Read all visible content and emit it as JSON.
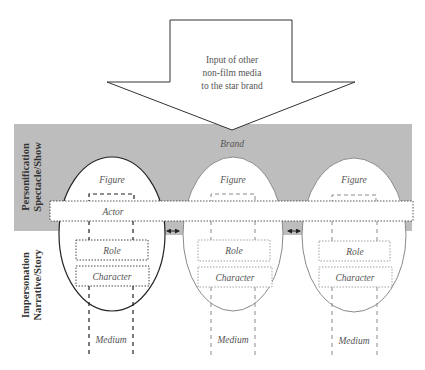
{
  "input_arrow": {
    "lines": [
      "Input of other",
      "non-film media",
      "to the star brand"
    ]
  },
  "band": {
    "label": "Brand",
    "color": "#bdbdbd"
  },
  "side_labels": {
    "top": [
      "Personification",
      "Spectacle/Show"
    ],
    "bottom": [
      "Impersonation",
      "Narrative/Story"
    ]
  },
  "actor_bar": {
    "label": "Actor"
  },
  "stars": [
    {
      "figure": "Figure",
      "role": "Role",
      "character": "Character",
      "medium": "Medium",
      "outline": "#222222"
    },
    {
      "figure": "Figure",
      "role": "Role",
      "character": "Character",
      "medium": "Medium",
      "outline": "#8a8a8a"
    },
    {
      "figure": "Figure",
      "role": "Role",
      "character": "Character",
      "medium": "Medium",
      "outline": "#8a8a8a"
    }
  ],
  "connectors": [
    {
      "symbol": "double-arrow"
    },
    {
      "symbol": "double-arrow"
    }
  ]
}
